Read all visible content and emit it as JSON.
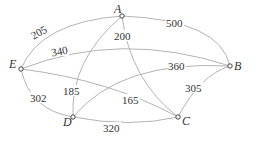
{
  "diagram": {
    "type": "weighted-graph",
    "nodes": [
      {
        "id": "A",
        "label": "A",
        "x": 122,
        "y": 16
      },
      {
        "id": "B",
        "label": "B",
        "x": 230,
        "y": 66
      },
      {
        "id": "C",
        "label": "C",
        "x": 178,
        "y": 117
      },
      {
        "id": "D",
        "label": "D",
        "x": 73,
        "y": 117
      },
      {
        "id": "E",
        "label": "E",
        "x": 21,
        "y": 69
      }
    ],
    "edges": [
      {
        "from": "A",
        "to": "E",
        "weight": "205"
      },
      {
        "from": "A",
        "to": "B",
        "weight": "500"
      },
      {
        "from": "A",
        "to": "D",
        "weight": "185"
      },
      {
        "from": "A",
        "to": "C",
        "weight": "200"
      },
      {
        "from": "E",
        "to": "B",
        "weight": "340"
      },
      {
        "from": "E",
        "to": "D",
        "weight": "302"
      },
      {
        "from": "E",
        "to": "C",
        "weight": "165"
      },
      {
        "from": "D",
        "to": "B",
        "weight": "360"
      },
      {
        "from": "D",
        "to": "C",
        "weight": "320"
      },
      {
        "from": "C",
        "to": "B",
        "weight": "305"
      }
    ]
  }
}
